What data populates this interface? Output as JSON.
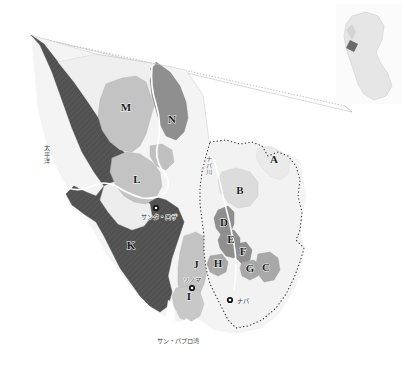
{
  "map": {
    "title": "ナパ・ソノマ ワイン産地図",
    "background_color": "#ffffff",
    "county_border_style": "dotted",
    "county_border_color": "#3a3a3a",
    "leader_line_color": "#8c8c8c",
    "palette": {
      "ocean": "#ffffff",
      "dark_hatched": "#5a5a5a",
      "mid_dark": "#8f8f8f",
      "mid": "#a8a8a8",
      "mid_light": "#c3c3c3",
      "light": "#dcdcdc",
      "very_light": "#efefef",
      "pale": "#f7f7f7",
      "river": "#ffffff",
      "outline": "#7a7a7a",
      "label_text": "#1c1c1c"
    },
    "regions": [
      {
        "id": "A",
        "label": "A",
        "x": 274,
        "y": 160,
        "tone": "very_light"
      },
      {
        "id": "B",
        "label": "B",
        "x": 240,
        "y": 191,
        "tone": "light"
      },
      {
        "id": "C",
        "label": "C",
        "x": 266,
        "y": 268,
        "tone": "mid"
      },
      {
        "id": "D",
        "label": "D",
        "x": 224,
        "y": 223,
        "tone": "mid_dark"
      },
      {
        "id": "E",
        "label": "E",
        "x": 231,
        "y": 240,
        "tone": "mid_dark"
      },
      {
        "id": "F",
        "label": "F",
        "x": 243,
        "y": 252,
        "tone": "mid_dark"
      },
      {
        "id": "G",
        "label": "G",
        "x": 250,
        "y": 269,
        "tone": "mid"
      },
      {
        "id": "H",
        "label": "H",
        "x": 218,
        "y": 264,
        "tone": "mid"
      },
      {
        "id": "I",
        "label": "I",
        "x": 189,
        "y": 297,
        "tone": "mid_light"
      },
      {
        "id": "J",
        "label": "J",
        "x": 196,
        "y": 265,
        "tone": "mid_light"
      },
      {
        "id": "K",
        "label": "K",
        "x": 131,
        "y": 246,
        "tone": "dark_hatched"
      },
      {
        "id": "L",
        "label": "L",
        "x": 137,
        "y": 180,
        "tone": "mid_light"
      },
      {
        "id": "M",
        "label": "M",
        "x": 126,
        "y": 108,
        "tone": "mid_light"
      },
      {
        "id": "N",
        "label": "N",
        "x": 172,
        "y": 120,
        "tone": "mid_dark"
      }
    ],
    "cities": [
      {
        "name": "サンタ・ロザ",
        "marker_x": 156,
        "marker_y": 208,
        "label_x": 141,
        "label_y": 217,
        "anchor": "start"
      },
      {
        "name": "ソノマ",
        "marker_x": 192,
        "marker_y": 288,
        "label_x": 192,
        "label_y": 280,
        "anchor": "middle"
      },
      {
        "name": "ナパ",
        "marker_x": 230,
        "marker_y": 300,
        "label_x": 237,
        "label_y": 301,
        "anchor": "start"
      }
    ],
    "water_labels": [
      {
        "name": "太平洋",
        "x": 47,
        "y": 168,
        "orientation": "vertical"
      },
      {
        "name": "ナパ川",
        "x": 209,
        "y": 178,
        "orientation": "vertical"
      },
      {
        "name": "サン・パブロ湾",
        "x": 178,
        "y": 341,
        "orientation": "horizontal"
      }
    ],
    "inset": {
      "name": "カリフォルニア州",
      "x": 336,
      "y": 4,
      "width": 66,
      "height": 100,
      "fill": "#e6e6e6",
      "frame_fill": "#fbfbfb",
      "marker_label": "ベイエリア"
    }
  }
}
